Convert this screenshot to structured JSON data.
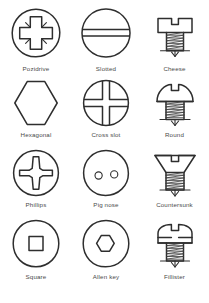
{
  "diagram": {
    "background_color": "#ffffff",
    "line_color": "#2e2e2e",
    "caption_color": "#4a4a4a",
    "columns": 3,
    "rows": 4,
    "items": [
      {
        "label": "Pozidrive",
        "icon": "pozidrive-screw-head-icon",
        "view": "top"
      },
      {
        "label": "Slotted",
        "icon": "slotted-screw-head-icon",
        "view": "top"
      },
      {
        "label": "Cheese",
        "icon": "cheese-head-screw-icon",
        "view": "side"
      },
      {
        "label": "Hexagonal",
        "icon": "hexagonal-screw-head-icon",
        "view": "top"
      },
      {
        "label": "Cross slot",
        "icon": "cross-slot-screw-head-icon",
        "view": "top"
      },
      {
        "label": "Round",
        "icon": "round-head-screw-icon",
        "view": "side"
      },
      {
        "label": "Phillips",
        "icon": "phillips-screw-head-icon",
        "view": "top"
      },
      {
        "label": "Pig nose",
        "icon": "pig-nose-screw-head-icon",
        "view": "top"
      },
      {
        "label": "Countersunk",
        "icon": "countersunk-head-screw-icon",
        "view": "side"
      },
      {
        "label": "Square",
        "icon": "square-screw-head-icon",
        "view": "top"
      },
      {
        "label": "Allen key",
        "icon": "allen-key-screw-head-icon",
        "view": "top"
      },
      {
        "label": "Fillister",
        "icon": "fillister-head-screw-icon",
        "view": "side"
      }
    ]
  }
}
